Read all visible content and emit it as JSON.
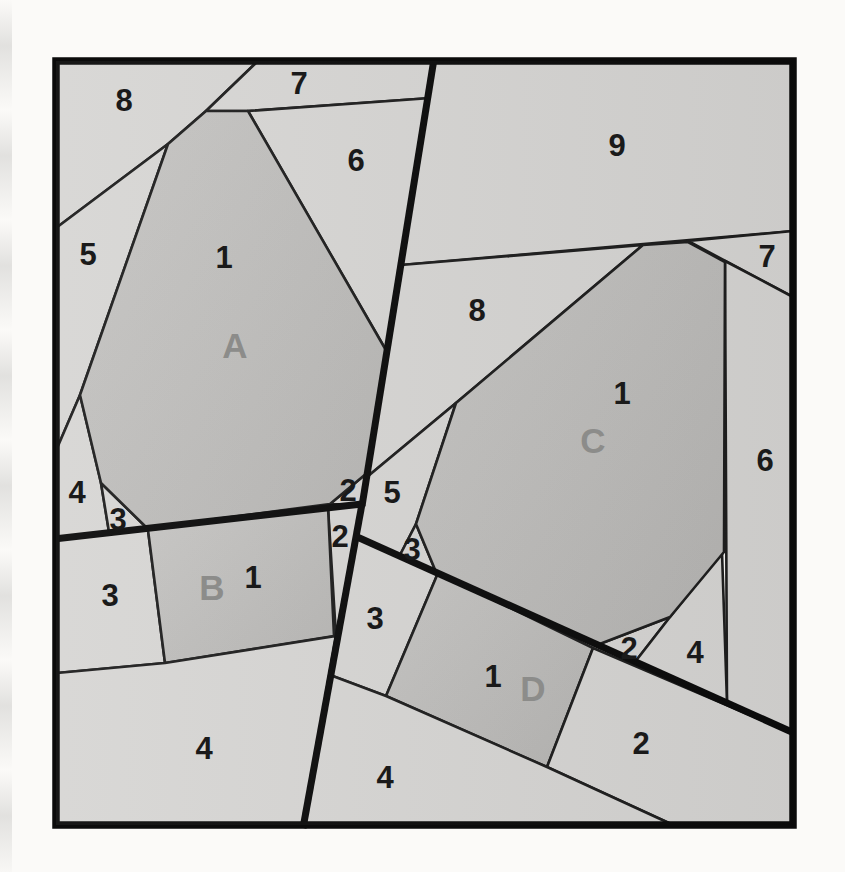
{
  "diagram": {
    "title_hidden": "paper piecing block diagram",
    "canvas": {
      "w": 845,
      "h": 872,
      "bg": "#fbfaf8"
    },
    "square": {
      "x": 56,
      "y": 61,
      "w": 737,
      "h": 764,
      "border_width": 7.5
    },
    "colors": {
      "light_fill": "#d7d6d4",
      "shaded_fill_a": "#c6c5c3",
      "shaded_fill_b": "#b6b5b3",
      "thin_line": "#1e1e1e",
      "thick_line": "#0b0b0b",
      "number_color": "#1a1a1a",
      "letter_color": "#8c8c8a"
    },
    "stroke": {
      "thin": 2.6,
      "thick": 7
    },
    "pieces": [
      {
        "name": "A-8",
        "shaded": false,
        "points": [
          [
            56,
            61
          ],
          [
            258,
            61
          ],
          [
            206,
            111
          ],
          [
            168,
            144
          ],
          [
            56,
            228
          ]
        ]
      },
      {
        "name": "A-7",
        "shaded": false,
        "points": [
          [
            258,
            61
          ],
          [
            434,
            61
          ],
          [
            431,
            98
          ],
          [
            248,
            111
          ],
          [
            206,
            111
          ]
        ]
      },
      {
        "name": "A-6",
        "shaded": false,
        "points": [
          [
            248,
            111
          ],
          [
            431,
            98
          ],
          [
            387,
            352
          ]
        ]
      },
      {
        "name": "A-5",
        "shaded": false,
        "points": [
          [
            56,
            228
          ],
          [
            168,
            144
          ],
          [
            80,
            395
          ],
          [
            55,
            453
          ]
        ]
      },
      {
        "name": "A-4",
        "shaded": false,
        "points": [
          [
            55,
            453
          ],
          [
            80,
            395
          ],
          [
            101,
            483
          ],
          [
            109,
            532
          ],
          [
            56,
            538
          ]
        ]
      },
      {
        "name": "A-3",
        "shaded": false,
        "points": [
          [
            101,
            483
          ],
          [
            147,
            528
          ],
          [
            109,
            532
          ]
        ]
      },
      {
        "name": "A-2",
        "shaded": false,
        "points": [
          [
            367,
            473
          ],
          [
            362,
            505
          ],
          [
            330,
            504
          ]
        ]
      },
      {
        "name": "A-1",
        "shaded": true,
        "points": [
          [
            206,
            111
          ],
          [
            248,
            111
          ],
          [
            387,
            352
          ],
          [
            367,
            473
          ],
          [
            330,
            504
          ],
          [
            147,
            528
          ],
          [
            101,
            483
          ],
          [
            80,
            395
          ],
          [
            168,
            144
          ]
        ]
      },
      {
        "name": "B-3",
        "shaded": false,
        "points": [
          [
            56,
            538
          ],
          [
            148,
            530
          ],
          [
            165,
            663
          ],
          [
            57,
            673
          ]
        ]
      },
      {
        "name": "B-2",
        "shaded": false,
        "points": [
          [
            328,
            507
          ],
          [
            361,
            505
          ],
          [
            336,
            636
          ]
        ]
      },
      {
        "name": "B-1",
        "shaded": true,
        "points": [
          [
            148,
            530
          ],
          [
            328,
            507
          ],
          [
            334,
            636
          ],
          [
            165,
            663
          ]
        ]
      },
      {
        "name": "B-4",
        "shaded": false,
        "points": [
          [
            57,
            673
          ],
          [
            165,
            663
          ],
          [
            336,
            636
          ],
          [
            303,
            824
          ],
          [
            57,
            824
          ]
        ]
      },
      {
        "name": "C-9",
        "shaded": false,
        "points": [
          [
            434,
            61
          ],
          [
            793,
            61
          ],
          [
            793,
            231
          ],
          [
            401,
            265
          ]
        ]
      },
      {
        "name": "C-7",
        "shaded": false,
        "points": [
          [
            688,
            241
          ],
          [
            793,
            231
          ],
          [
            793,
            297
          ]
        ]
      },
      {
        "name": "C-8",
        "shaded": false,
        "points": [
          [
            401,
            265
          ],
          [
            643,
            245
          ],
          [
            456,
            403
          ],
          [
            367,
            477
          ]
        ]
      },
      {
        "name": "C-6",
        "shaded": false,
        "points": [
          [
            725,
            261
          ],
          [
            793,
            297
          ],
          [
            793,
            733
          ],
          [
            727,
            703
          ]
        ]
      },
      {
        "name": "C-5",
        "shaded": false,
        "points": [
          [
            367,
            477
          ],
          [
            456,
            403
          ],
          [
            416,
            524
          ],
          [
            400,
            555
          ],
          [
            356,
            535
          ],
          [
            362,
            505
          ]
        ]
      },
      {
        "name": "C-3",
        "shaded": false,
        "points": [
          [
            416,
            524
          ],
          [
            436,
            572
          ],
          [
            400,
            555
          ]
        ]
      },
      {
        "name": "C-2",
        "shaded": false,
        "points": [
          [
            670,
            617
          ],
          [
            635,
            662
          ],
          [
            597,
            645
          ]
        ]
      },
      {
        "name": "C-4",
        "shaded": false,
        "points": [
          [
            722,
            552
          ],
          [
            670,
            617
          ],
          [
            635,
            662
          ],
          [
            727,
            703
          ]
        ]
      },
      {
        "name": "C-1",
        "shaded": true,
        "points": [
          [
            643,
            245
          ],
          [
            688,
            242
          ],
          [
            725,
            262
          ],
          [
            724,
            552
          ],
          [
            670,
            617
          ],
          [
            597,
            645
          ],
          [
            436,
            572
          ],
          [
            416,
            524
          ],
          [
            456,
            403
          ]
        ]
      },
      {
        "name": "D-3",
        "shaded": false,
        "points": [
          [
            356,
            535
          ],
          [
            438,
            573
          ],
          [
            386,
            696
          ],
          [
            330,
            675
          ]
        ]
      },
      {
        "name": "D-1",
        "shaded": true,
        "points": [
          [
            438,
            573
          ],
          [
            593,
            648
          ],
          [
            547,
            767
          ],
          [
            386,
            696
          ]
        ]
      },
      {
        "name": "D-2",
        "shaded": false,
        "points": [
          [
            593,
            648
          ],
          [
            792,
            733
          ],
          [
            792,
            824
          ],
          [
            671,
            824
          ],
          [
            547,
            767
          ]
        ]
      },
      {
        "name": "D-4",
        "shaded": false,
        "points": [
          [
            330,
            675
          ],
          [
            386,
            696
          ],
          [
            547,
            767
          ],
          [
            671,
            824
          ],
          [
            303,
            824
          ]
        ]
      }
    ],
    "thick_lines": [
      {
        "name": "seam-top-vertical",
        "x1": 434,
        "y1": 59,
        "x2": 362,
        "y2": 506
      },
      {
        "name": "seam-left-horizontal",
        "x1": 54,
        "y1": 539,
        "x2": 362,
        "y2": 504
      },
      {
        "name": "seam-bottom-vertical",
        "x1": 362,
        "y1": 504,
        "x2": 303,
        "y2": 828
      },
      {
        "name": "seam-right-diagonal",
        "x1": 355,
        "y1": 536,
        "x2": 794,
        "y2": 733
      }
    ],
    "labels": [
      {
        "text": "8",
        "x": 124,
        "y": 100,
        "type": "number",
        "name": "label-A8"
      },
      {
        "text": "7",
        "x": 299,
        "y": 83,
        "type": "number",
        "name": "label-A7"
      },
      {
        "text": "6",
        "x": 356,
        "y": 160,
        "type": "number",
        "name": "label-A6"
      },
      {
        "text": "5",
        "x": 88,
        "y": 254,
        "type": "number",
        "name": "label-A5"
      },
      {
        "text": "1",
        "x": 224,
        "y": 257,
        "type": "number",
        "name": "label-A1"
      },
      {
        "text": "A",
        "x": 235,
        "y": 345,
        "type": "letter",
        "name": "label-A-letter"
      },
      {
        "text": "4",
        "x": 77,
        "y": 492,
        "type": "number",
        "name": "label-A4"
      },
      {
        "text": "3",
        "x": 118,
        "y": 519,
        "type": "number",
        "name": "label-A3"
      },
      {
        "text": "2",
        "x": 348,
        "y": 490,
        "type": "number",
        "name": "label-A2"
      },
      {
        "text": "2",
        "x": 340,
        "y": 536,
        "type": "number",
        "name": "label-B2"
      },
      {
        "text": "3",
        "x": 110,
        "y": 595,
        "type": "number",
        "name": "label-B3"
      },
      {
        "text": "B",
        "x": 212,
        "y": 587,
        "type": "letter",
        "name": "label-B-letter"
      },
      {
        "text": "1",
        "x": 253,
        "y": 577,
        "type": "number",
        "name": "label-B1"
      },
      {
        "text": "4",
        "x": 204,
        "y": 748,
        "type": "number",
        "name": "label-B4"
      },
      {
        "text": "9",
        "x": 617,
        "y": 145,
        "type": "number",
        "name": "label-C9"
      },
      {
        "text": "8",
        "x": 477,
        "y": 310,
        "type": "number",
        "name": "label-C8"
      },
      {
        "text": "7",
        "x": 767,
        "y": 256,
        "type": "number",
        "name": "label-C7"
      },
      {
        "text": "1",
        "x": 622,
        "y": 393,
        "type": "number",
        "name": "label-C1"
      },
      {
        "text": "C",
        "x": 593,
        "y": 440,
        "type": "letter",
        "name": "label-C-letter"
      },
      {
        "text": "6",
        "x": 765,
        "y": 460,
        "type": "number",
        "name": "label-C6"
      },
      {
        "text": "5",
        "x": 392,
        "y": 492,
        "type": "number",
        "name": "label-C5"
      },
      {
        "text": "3",
        "x": 412,
        "y": 549,
        "type": "number",
        "name": "label-C3"
      },
      {
        "text": "2",
        "x": 629,
        "y": 648,
        "type": "number",
        "name": "label-C2"
      },
      {
        "text": "4",
        "x": 695,
        "y": 652,
        "type": "number",
        "name": "label-C4"
      },
      {
        "text": "3",
        "x": 375,
        "y": 618,
        "type": "number",
        "name": "label-D3"
      },
      {
        "text": "1",
        "x": 493,
        "y": 676,
        "type": "number",
        "name": "label-D1"
      },
      {
        "text": "D",
        "x": 533,
        "y": 688,
        "type": "letter",
        "name": "label-D-letter"
      },
      {
        "text": "2",
        "x": 641,
        "y": 743,
        "type": "number",
        "name": "label-D2"
      },
      {
        "text": "4",
        "x": 385,
        "y": 777,
        "type": "number",
        "name": "label-D4"
      }
    ]
  }
}
